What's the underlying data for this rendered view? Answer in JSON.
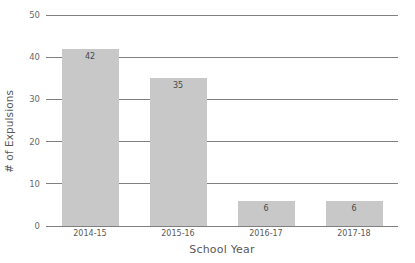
{
  "chart_data": {
    "type": "bar",
    "title": "",
    "xlabel": "School Year",
    "ylabel": "# of Expulsions",
    "categories": [
      "2014-15",
      "2015-16",
      "2016-17",
      "2017-18"
    ],
    "values": [
      42,
      35,
      6,
      6
    ],
    "value_labels": [
      "42",
      "35",
      "6",
      "6"
    ],
    "ylim": [
      0,
      50
    ],
    "yticks": [
      0,
      10,
      20,
      30,
      40,
      50
    ],
    "ytick_labels": [
      "0",
      "10",
      "20",
      "30",
      "40",
      "50"
    ],
    "grid": "horizontal",
    "legend": "none",
    "colors": {
      "bar_fill": "#c8c8c8",
      "gridline": "#7f7f7f",
      "tick_text": "#6b6b6b",
      "axis_title": "#595959",
      "value_label": "#4a4a4a",
      "background": "#ffffff"
    }
  }
}
